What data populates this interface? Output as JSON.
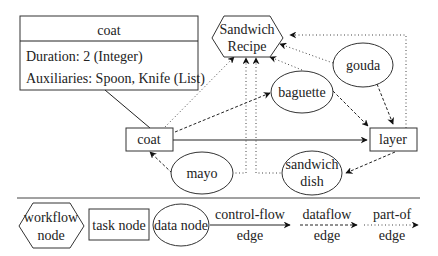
{
  "attribute_box": {
    "title": "coat",
    "rows": [
      "Duration: 2 (Integer)",
      "Auxiliaries: Spoon, Knife (List)"
    ]
  },
  "nodes": {
    "workflow": {
      "line1": "Sandwich",
      "line2": "Recipe"
    },
    "task_coat": "coat",
    "task_layer": "layer",
    "data_baguette": "baguette",
    "data_gouda": "gouda",
    "data_mayo": "mayo",
    "data_dish": {
      "line1": "sandwich",
      "line2": "dish"
    }
  },
  "legend": {
    "workflow_node": {
      "line1": "workflow",
      "line2": "node"
    },
    "task_node": "task node",
    "data_node": "data node",
    "control_flow": {
      "line1": "control-flow",
      "line2": "edge"
    },
    "dataflow": {
      "line1": "dataflow",
      "line2": "edge"
    },
    "part_of": {
      "line1": "part-of",
      "line2": "edge"
    }
  },
  "colors": {
    "stroke": "#333333",
    "background": "#ffffff"
  }
}
